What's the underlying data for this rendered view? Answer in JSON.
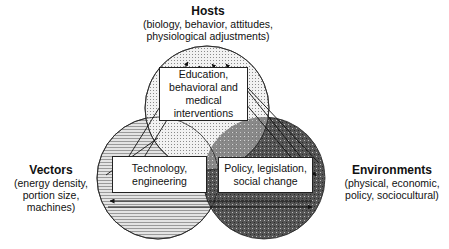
{
  "diagram": {
    "type": "venn",
    "circles": [
      {
        "id": "hosts",
        "cx": 207,
        "cy": 108,
        "r": 62,
        "fill": "#e6e6e6",
        "pattern": "fine-dots"
      },
      {
        "id": "vectors",
        "cx": 158,
        "cy": 178,
        "r": 61,
        "fill": "#d2d2d2",
        "pattern": "horizontal-hatch"
      },
      {
        "id": "environments",
        "cx": 264,
        "cy": 178,
        "r": 61,
        "fill": "#5a5a5a",
        "pattern": "dark-grid"
      }
    ]
  },
  "labels": {
    "hosts": {
      "title": "Hosts",
      "line1": "(biology, behavior, attitudes,",
      "line2": "physiological adjustments)"
    },
    "vectors": {
      "title": "Vectors",
      "line1": "(energy density,",
      "line2": "portion size,",
      "line3": "machines)"
    },
    "environments": {
      "title": "Environments",
      "line1": "(physical, economic,",
      "line2": "policy, sociocultural)"
    }
  },
  "boxes": {
    "education": {
      "line1": "Education,",
      "line2": "behavioral and",
      "line3": "medical",
      "line4": "interventions"
    },
    "technology": {
      "line1": "Technology,",
      "line2": "engineering"
    },
    "policy": {
      "line1": "Policy, legislation,",
      "line2": "social change"
    }
  },
  "colors": {
    "line": "#111111",
    "box_bg": "#ffffff",
    "hosts_fill": "#e8e8e8",
    "vectors_fill": "#cfcfcf",
    "environments_fill": "#4d4d4d"
  }
}
